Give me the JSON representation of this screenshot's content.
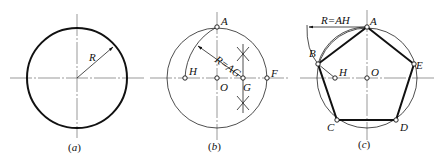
{
  "figures": [
    {
      "id": "a",
      "caption": "a",
      "labels": {
        "radius": "R"
      }
    },
    {
      "id": "b",
      "caption": "b",
      "labels": {
        "A": "A",
        "H": "H",
        "O": "O",
        "G": "G",
        "F": "F",
        "radius": "R=AG"
      }
    },
    {
      "id": "c",
      "caption": "c",
      "labels": {
        "A": "A",
        "B": "B",
        "C": "C",
        "D": "D",
        "E": "E",
        "H": "H",
        "O": "O",
        "radius": "R=AH"
      }
    }
  ],
  "caption_open": "(",
  "caption_close": ")"
}
